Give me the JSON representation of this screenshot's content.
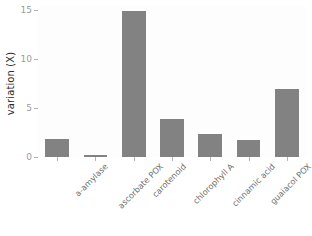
{
  "chart_data": {
    "type": "bar",
    "title": "",
    "subtitle": "",
    "xlabel": "",
    "ylabel": "variation (X)",
    "categories": [
      "a-amylase",
      "ascorbate POX",
      "carotenoid",
      "chlorophyll A",
      "cinnamic acid",
      "guaiacol POX",
      "Phe ammonium lyase"
    ],
    "values": [
      1.9,
      0.25,
      15.0,
      3.9,
      2.4,
      1.7,
      7.0
    ],
    "ylim": [
      0,
      15.5
    ],
    "yticks": [
      0,
      5,
      10,
      15
    ],
    "ytick_labels": [
      "0",
      "5",
      "10",
      "15"
    ],
    "grid": false,
    "legend": false,
    "legend_position": "none",
    "bar_color": "#828282",
    "background_color": "#fdfdfd",
    "tick_color": "#b4b4b4",
    "tick_label_color": "#9b9b9b",
    "axis_title_color": "#2b2b2b",
    "xtick_label_rotation": -45
  },
  "axis": {
    "y_title": "variation (X)"
  },
  "yticks": [
    {
      "label": "15",
      "value": 15
    },
    {
      "label": "10",
      "value": 10
    },
    {
      "label": "5",
      "value": 5
    },
    {
      "label": "0",
      "value": 0
    }
  ],
  "bars": [
    {
      "label": "a-amylase",
      "value": 1.9
    },
    {
      "label": "ascorbate POX",
      "value": 0.25
    },
    {
      "label": "carotenoid",
      "value": 15.0
    },
    {
      "label": "chlorophyll A",
      "value": 3.9
    },
    {
      "label": "cinnamic acid",
      "value": 2.4
    },
    {
      "label": "guaiacol POX",
      "value": 1.7
    },
    {
      "label": "Phe ammonium lyase",
      "value": 7.0
    }
  ]
}
